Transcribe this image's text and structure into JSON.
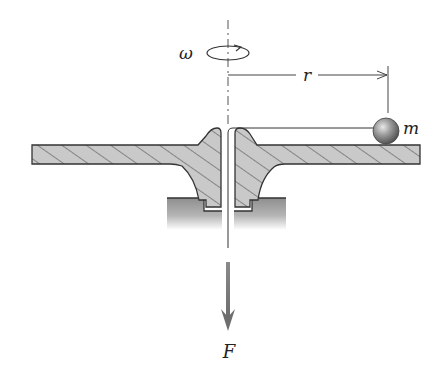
{
  "diagram": {
    "labels": {
      "omega": "ω",
      "radius": "r",
      "mass": "m",
      "force": "F"
    },
    "colors": {
      "hatch_fill": "#c8c8c8",
      "hatch_line": "#555555",
      "outline": "#333333",
      "ground": "#9a9a9a",
      "arrow": "#707070",
      "ball": "#8a8a8a"
    }
  }
}
